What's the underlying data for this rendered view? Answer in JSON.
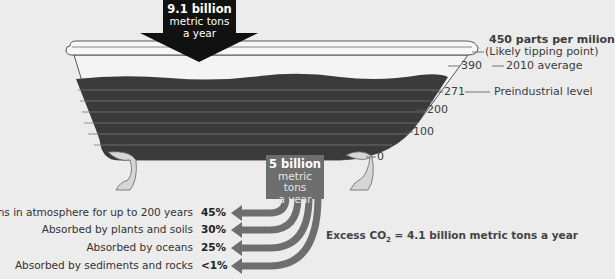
{
  "inflow": {
    "amount": "9.1 billion",
    "unit": "metric tons",
    "period": "a year"
  },
  "outflow": {
    "amount": "5 billion",
    "unit": "metric tons",
    "period": "a year"
  },
  "tipping_point": {
    "value": "450 parts per milion",
    "note": "(Likely tipping point)"
  },
  "scale": {
    "marks": [
      {
        "value": "390",
        "label": "2010 average"
      },
      {
        "value": "271",
        "label": "Preindustrial level"
      },
      {
        "value": "200",
        "label": ""
      },
      {
        "value": "100",
        "label": ""
      },
      {
        "value": "0",
        "label": ""
      }
    ]
  },
  "fates": [
    {
      "label": "Remains in atmosphere for up to 200 years",
      "percent": "45%"
    },
    {
      "label": "Absorbed by plants and soils",
      "percent": "30%"
    },
    {
      "label": "Absorbed by oceans",
      "percent": "25%"
    },
    {
      "label": "Absorbed by sediments and rocks",
      "percent": "<1%"
    }
  ],
  "excess": {
    "prefix": "Excess CO",
    "subscript": "2",
    "suffix": " = 4.1 billion metric tons a year"
  },
  "colors": {
    "background": "#ececec",
    "water": "#3a3a3a",
    "inflow_arrow": "#111111",
    "outflow": "#6e6e6e",
    "feet": "#d6d6d6"
  }
}
